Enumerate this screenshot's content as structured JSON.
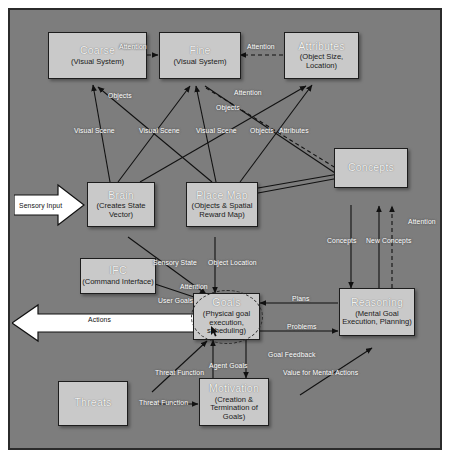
{
  "diagram": {
    "background_color": "#7d7d7d",
    "node_fill": "#c9c9c9",
    "node_border": "#1d1d1d",
    "nodes": [
      {
        "id": "coarse",
        "title": "Coarse",
        "sub": "(Visual System)"
      },
      {
        "id": "fine",
        "title": "Fine",
        "sub": "(Visual System)"
      },
      {
        "id": "attributes",
        "title": "Attributes",
        "sub": "(Object Size,\nLocation)"
      },
      {
        "id": "concepts",
        "title": "Concepts",
        "sub": ""
      },
      {
        "id": "brain",
        "title": "Brain",
        "sub": "(Creates State\nVector)"
      },
      {
        "id": "placemap",
        "title": "Place Map",
        "sub": "(Objects & Spatial\nReward Map)"
      },
      {
        "id": "ifc",
        "title": "IFC",
        "sub": "(Command Interface)"
      },
      {
        "id": "goals",
        "title": "Goals",
        "sub": "(Physical goal\nexecution,\nscheduling)"
      },
      {
        "id": "reasoning",
        "title": "Reasoning",
        "sub": "(Mental Goal\nExecution, Planning)"
      },
      {
        "id": "threats",
        "title": "Threats",
        "sub": ""
      },
      {
        "id": "motivation",
        "title": "Motivation",
        "sub": "(Creation &\nTermination of\nGoals)"
      }
    ],
    "io_arrows": [
      {
        "id": "sensory-input",
        "label": "Sensory Input",
        "direction": "right"
      },
      {
        "id": "actions",
        "label": "Actions",
        "direction": "left"
      }
    ],
    "edge_labels": [
      {
        "id": "attention-coarse-fine",
        "text": "Attention"
      },
      {
        "id": "attention-attr-fine",
        "text": "Attention"
      },
      {
        "id": "objects-top",
        "text": "Objects"
      },
      {
        "id": "attention-mid",
        "text": "Attention"
      },
      {
        "id": "objects-mid",
        "text": "Objects"
      },
      {
        "id": "visual-scene-1",
        "text": "Visual Scene"
      },
      {
        "id": "visual-scene-2",
        "text": "Visual Scene"
      },
      {
        "id": "visual-scene-3",
        "text": "Visual Scene"
      },
      {
        "id": "objects-right",
        "text": "Objects"
      },
      {
        "id": "attributes-right",
        "text": "Attributes"
      },
      {
        "id": "attention-concepts",
        "text": "Attention"
      },
      {
        "id": "concepts-down",
        "text": "Concepts"
      },
      {
        "id": "new-concepts",
        "text": "New Concepts"
      },
      {
        "id": "sensory-state",
        "text": "Sensory State"
      },
      {
        "id": "object-location",
        "text": "Object Location"
      },
      {
        "id": "attention-ifc",
        "text": "Attention"
      },
      {
        "id": "user-goals",
        "text": "User Goals"
      },
      {
        "id": "plans",
        "text": "Plans"
      },
      {
        "id": "problems",
        "text": "Problems"
      },
      {
        "id": "goal-feedback",
        "text": "Goal Feedback"
      },
      {
        "id": "value-mental-actions",
        "text": "Value for Mental Actions"
      },
      {
        "id": "agent-goals",
        "text": "Agent Goals"
      },
      {
        "id": "threat-function-1",
        "text": "Threat Function"
      },
      {
        "id": "threat-function-2",
        "text": "Threat Function"
      }
    ]
  }
}
